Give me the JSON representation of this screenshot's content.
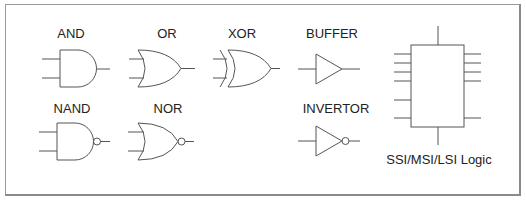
{
  "diagram": {
    "gates": [
      {
        "id": "and",
        "label": "AND"
      },
      {
        "id": "or",
        "label": "OR"
      },
      {
        "id": "xor",
        "label": "XOR"
      },
      {
        "id": "buffer",
        "label": "BUFFER"
      },
      {
        "id": "nand",
        "label": "NAND"
      },
      {
        "id": "nor",
        "label": "NOR"
      },
      {
        "id": "invertor",
        "label": "INVERTOR"
      }
    ],
    "ic_block": {
      "label": "SSI/MSI/LSI Logic",
      "left_pins": 6,
      "right_pins": 5,
      "top_pins": 1,
      "bottom_pins": 1
    },
    "stroke_color": "#555555"
  }
}
